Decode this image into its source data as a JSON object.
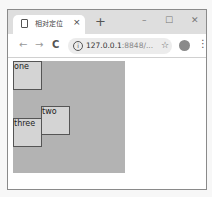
{
  "browser": {
    "tab": {
      "title": "相对定位",
      "close": "×"
    },
    "new_tab": "+",
    "window_controls": {
      "minimize": "–",
      "maximize": "☐",
      "close": "✕"
    },
    "nav": {
      "back": "←",
      "forward": "→",
      "reload": "C"
    },
    "address": {
      "info": "i",
      "url_main": "127.0.0.1",
      "url_rest": ":8848/..."
    },
    "star": "☆",
    "menu": "⋮"
  },
  "page": {
    "container_color": "#b3b3b3",
    "boxes": [
      {
        "label": "one"
      },
      {
        "label": "two"
      },
      {
        "label": "three"
      }
    ]
  }
}
